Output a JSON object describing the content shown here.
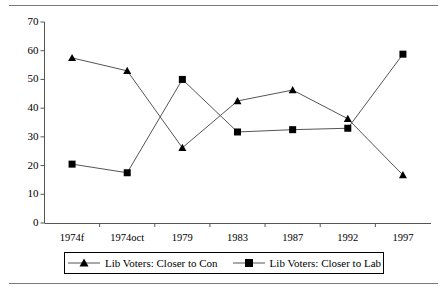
{
  "chart_data": {
    "type": "line",
    "title": "",
    "subtitle": "",
    "xlabel": "",
    "ylabel": "",
    "categories": [
      "1974f",
      "1974oct",
      "1979",
      "1983",
      "1987",
      "1992",
      "1997"
    ],
    "ylim": [
      0,
      70
    ],
    "yticks": [
      0,
      10,
      20,
      30,
      40,
      50,
      60,
      70
    ],
    "ytick_labels": [
      "0",
      "10",
      "20",
      "30",
      "40",
      "50",
      "60",
      "70"
    ],
    "grid": false,
    "legend_position": "bottom",
    "series": [
      {
        "name": "Lib Voters: Closer to Con",
        "marker": "triangle",
        "color": "#000000",
        "values": [
          57.5,
          53.0,
          26.2,
          42.5,
          46.3,
          36.3,
          16.7
        ]
      },
      {
        "name": "Lib Voters: Closer to Lab",
        "marker": "square",
        "color": "#000000",
        "values": [
          20.5,
          17.5,
          50.0,
          31.7,
          32.5,
          33.0,
          58.8
        ]
      }
    ]
  },
  "legend": {
    "items": [
      {
        "label": "Lib Voters: Closer to Con",
        "marker": "triangle-marker-icon"
      },
      {
        "label": "Lib Voters: Closer to Lab",
        "marker": "square-marker-icon"
      }
    ]
  },
  "colors": {
    "line": "#555555",
    "marker": "#000000",
    "axis": "#555555",
    "rule": "#7a7a7a",
    "background": "#ffffff"
  }
}
